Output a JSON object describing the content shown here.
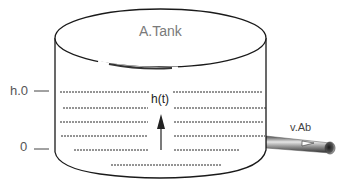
{
  "diagram": {
    "type": "cylindrical-tank",
    "tank_label": "A.Tank",
    "level_markers": [
      {
        "label": "h.0",
        "meaning": "initial water level"
      },
      {
        "label": "0",
        "meaning": "bottom level"
      }
    ],
    "height_label": "h(t)",
    "outlet_label": "v.Ab",
    "colors": {
      "outline": "#1a1a1a",
      "text_gray": "#7a7a7a",
      "pipe_dark": "#3a3a3a",
      "pipe_light": "#d8d8d8",
      "background": "#ffffff"
    }
  }
}
